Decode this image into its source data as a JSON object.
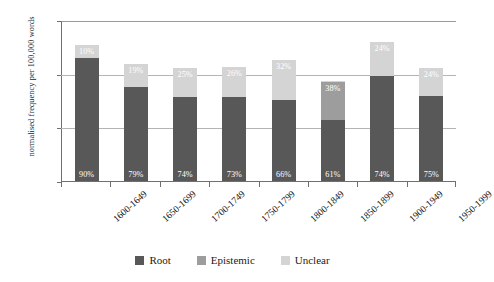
{
  "chart_data": {
    "type": "bar",
    "subtype": "stacked-bar-percent-labeled",
    "title": "",
    "subtitle": "",
    "xlabel": "",
    "ylabel": "normalised frequency per 100,000 words",
    "ylim": [
      0,
      150
    ],
    "yticks": [
      0,
      50,
      100,
      150
    ],
    "ytick_labels": [
      "0",
      "50",
      "100",
      "150"
    ],
    "grid": true,
    "grid_axis": "y",
    "legend_position": "bottom-center",
    "categories": [
      "1600-1649",
      "1650-1699",
      "1700-1749",
      "1750-1799",
      "1800-1849",
      "1850-1899",
      "1900-1949",
      "1950-1999"
    ],
    "totals": [
      127,
      111,
      106,
      107,
      115,
      93,
      132,
      106
    ],
    "series": [
      {
        "name": "Root",
        "color": "#585858",
        "values": [
          114.3,
          87.7,
          78.4,
          78.1,
          75.9,
          56.7,
          97.7,
          79.5
        ],
        "percent_labels": [
          "90%",
          "79%",
          "74%",
          "73%",
          "66%",
          "61%",
          "74%",
          "75%"
        ]
      },
      {
        "name": "Epistemic",
        "color": "#9d9d9d",
        "values": [
          0.0,
          0.0,
          0.0,
          0.0,
          0.0,
          35.3,
          0.0,
          0.0
        ],
        "percent_labels": [
          "",
          "",
          "",
          "",
          "",
          "38%",
          "",
          ""
        ]
      },
      {
        "name": "Unclear",
        "color": "#d4d4d4",
        "values": [
          12.7,
          21.1,
          26.5,
          27.8,
          36.8,
          1.0,
          31.7,
          25.4
        ],
        "percent_labels": [
          "10%",
          "19%",
          "25%",
          "26%",
          "32%",
          "",
          "24%",
          "24%"
        ]
      }
    ],
    "colors": {
      "root": "#585858",
      "epistemic": "#9d9d9d",
      "unclear": "#d4d4d4",
      "axis": "#6f6f6f",
      "gridline": "#b4b4b4",
      "label_text": "#ffffff",
      "background": "#ffffff"
    }
  },
  "legend": {
    "items": [
      {
        "label": "Root",
        "color": "#585858"
      },
      {
        "label": "Epistemic",
        "color": "#9d9d9d"
      },
      {
        "label": "Unclear",
        "color": "#d4d4d4"
      }
    ]
  }
}
